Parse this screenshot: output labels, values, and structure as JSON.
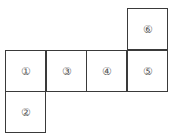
{
  "diagram": {
    "type": "cube-net",
    "faces": [
      {
        "label": "①",
        "col": 0,
        "row": 1
      },
      {
        "label": "③",
        "col": 1,
        "row": 1
      },
      {
        "label": "④",
        "col": 2,
        "row": 1
      },
      {
        "label": "⑤",
        "col": 3,
        "row": 1
      },
      {
        "label": "⑥",
        "col": 3,
        "row": 0
      },
      {
        "label": "②",
        "col": 0,
        "row": 2
      }
    ]
  }
}
